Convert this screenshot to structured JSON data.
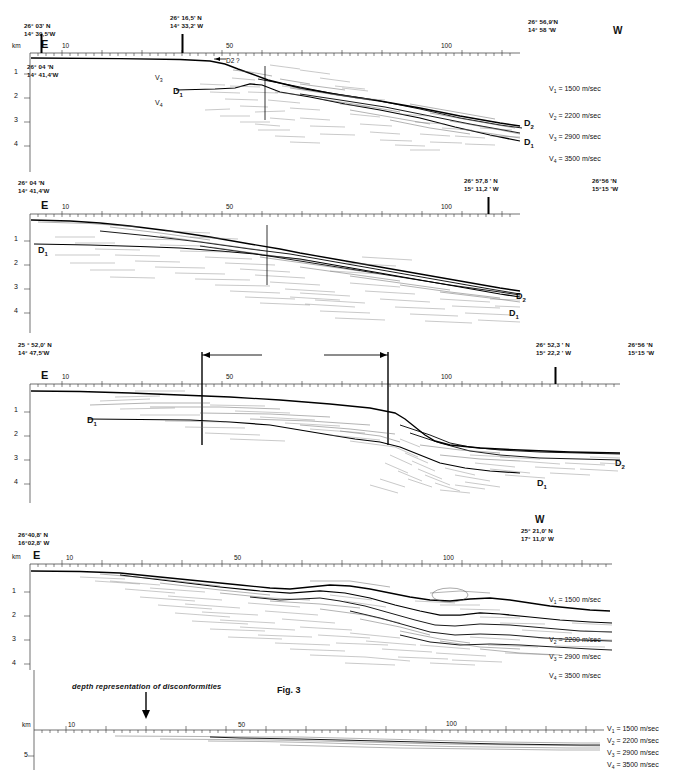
{
  "figure": {
    "type": "seismic-profile-sections",
    "depth_unit": "km",
    "distance_unit": "km"
  },
  "axis": {
    "km_label": "km",
    "tick_10": "10",
    "tick_50": "50",
    "tick_100": "100",
    "depth_ticks": [
      "1",
      "2",
      "3",
      "4"
    ],
    "deep_depth_tick": "5"
  },
  "direction": {
    "east": "E",
    "west": "W"
  },
  "horizons": {
    "d1": "D",
    "d1_sub": "1",
    "d2": "D",
    "d2_sub": "2",
    "d2_query": "D2 ?"
  },
  "velocity_labels": {
    "v1": "V",
    "v1_sub": "1",
    "v3": "V",
    "v3_sub": "3",
    "v4": "V",
    "v4_sub": "4"
  },
  "velocity_legend_spaced": [
    {
      "symbol": "V",
      "sub": "1",
      "value": "= 1500  m/sec"
    },
    {
      "symbol": "V",
      "sub": "2",
      "value": "= 2200  m/sec"
    },
    {
      "symbol": "V",
      "sub": "3",
      "value": "= 2900  m/sec"
    },
    {
      "symbol": "V",
      "sub": "4",
      "value": "= 3500  m/sec"
    }
  ],
  "velocity_legend_compact": [
    {
      "symbol": "V",
      "sub": "1",
      "value": "= 1500 m/sec"
    },
    {
      "symbol": "V",
      "sub": "2",
      "value": "= 2200 m/sec"
    },
    {
      "symbol": "V",
      "sub": "3",
      "value": "= 2900 m/sec"
    },
    {
      "symbol": "V",
      "sub": "4",
      "value": "= 3500 m/sec"
    }
  ],
  "velocity_legend_tight": [
    {
      "symbol": "V",
      "sub": "1",
      "value": "= 1500 m/sec"
    },
    {
      "symbol": "V",
      "sub": "2",
      "value": "= 2200 m/sec"
    },
    {
      "symbol": "V",
      "sub": "3",
      "value": "= 2900 m/sec"
    },
    {
      "symbol": "V",
      "sub": "4",
      "value": "= 3500 m/sec"
    }
  ],
  "panels": [
    {
      "id": "panel-1",
      "start_coord": "26° 03' N\n14° 39,5'W",
      "mid_coord": "26° 16,5' N\n14° 33,2' W",
      "end_coord": "26° 56,9'N\n14° 58 'W",
      "inner_coord": "26° 04 'N\n14° 41,4'W"
    },
    {
      "id": "panel-2",
      "start_coord": "26° 04 'N\n14° 41,4'W",
      "mid_coord": "26° 57,8 ' N\n15° 11,2 ' W",
      "end_coord": "26°56 'N\n15°15 'W"
    },
    {
      "id": "panel-3",
      "start_coord": "25 ° 52,0' N\n14° 47,5'W",
      "mid_coord": "26° 52,3 ' N\n15° 22,2 ' W",
      "end_coord": "26°56 'N\n15°15 'W",
      "bracket_label": "Fig. 3"
    },
    {
      "id": "panel-4",
      "start_coord": "26°40,8' N\n16°02,8' W",
      "end_coord": "25° 21,0' N\n17° 11,0' W"
    },
    {
      "id": "panel-5",
      "caption": "depth representation of disconformities"
    }
  ],
  "colors": {
    "ink": "#111111",
    "reflector_dark": "#000000",
    "reflector_light": "#777777"
  }
}
